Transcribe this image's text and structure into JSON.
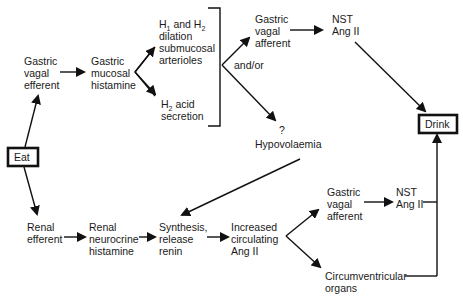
{
  "diagram": {
    "title": "",
    "nodes": {
      "eat": {
        "label": "Eat"
      },
      "drink": {
        "label": "Drink"
      },
      "gastric_vagal_efferent": {
        "lines": [
          "Gastric",
          "vagal",
          "efferent"
        ]
      },
      "gastric_mucosal_histamine": {
        "lines": [
          "Gastric",
          "mucosal",
          "histamine"
        ]
      },
      "h1_h2_dilation": {
        "line1_a": "H",
        "line1_sub1": "1",
        "line1_b": " and H",
        "line1_sub2": "2",
        "lines": [
          "dilation",
          "submucosal",
          "arterioles"
        ]
      },
      "h2_acid_secretion": {
        "line1_a": "H",
        "line1_sub": "2",
        "line1_b": " acid",
        "lines": [
          "secretion"
        ]
      },
      "gastric_vagal_afferent_top": {
        "lines": [
          "Gastric",
          "vagal",
          "afferent"
        ]
      },
      "nst_ang_ii_top": {
        "lines": [
          "NST",
          "Ang II"
        ]
      },
      "hypovolaemia": {
        "question": "?",
        "label": "Hypovolaemia"
      },
      "renal_efferent": {
        "lines": [
          "Renal",
          "efferent"
        ]
      },
      "renal_neurocrine_histamine": {
        "lines": [
          "Renal",
          "neurocrine",
          "histamine"
        ]
      },
      "synthesis_release_renin": {
        "lines": [
          "Synthesis,",
          "release",
          "renin"
        ]
      },
      "increased_circulating_ang_ii": {
        "lines": [
          "Increased",
          "circulating",
          "Ang II"
        ]
      },
      "gastric_vagal_afferent_bottom": {
        "lines": [
          "Gastric",
          "vagal",
          "afferent"
        ]
      },
      "nst_ang_ii_bottom": {
        "lines": [
          "NST",
          "Ang II"
        ]
      },
      "circumventricular_organs": {
        "lines": [
          "Circumventricular",
          "organs"
        ]
      }
    },
    "edge_labels": {
      "and_or": "and/or"
    },
    "edges": [
      {
        "from": "eat",
        "to": "gastric_vagal_efferent"
      },
      {
        "from": "eat",
        "to": "renal_efferent"
      },
      {
        "from": "gastric_vagal_efferent",
        "to": "gastric_mucosal_histamine"
      },
      {
        "from": "gastric_mucosal_histamine",
        "to": "h1_h2_dilation"
      },
      {
        "from": "gastric_mucosal_histamine",
        "to": "h2_acid_secretion"
      },
      {
        "from": "bracket",
        "to": "gastric_vagal_afferent_top",
        "label": "and/or"
      },
      {
        "from": "bracket",
        "to": "hypovolaemia",
        "label": "and/or"
      },
      {
        "from": "gastric_vagal_afferent_top",
        "to": "nst_ang_ii_top"
      },
      {
        "from": "nst_ang_ii_top",
        "to": "drink"
      },
      {
        "from": "hypovolaemia",
        "to": "synthesis_release_renin"
      },
      {
        "from": "renal_efferent",
        "to": "renal_neurocrine_histamine"
      },
      {
        "from": "renal_neurocrine_histamine",
        "to": "synthesis_release_renin"
      },
      {
        "from": "synthesis_release_renin",
        "to": "increased_circulating_ang_ii"
      },
      {
        "from": "increased_circulating_ang_ii",
        "to": "gastric_vagal_afferent_bottom"
      },
      {
        "from": "increased_circulating_ang_ii",
        "to": "circumventricular_organs"
      },
      {
        "from": "gastric_vagal_afferent_bottom",
        "to": "nst_ang_ii_bottom"
      },
      {
        "from": "nst_ang_ii_bottom",
        "to": "drink"
      },
      {
        "from": "circumventricular_organs",
        "to": "drink"
      }
    ]
  }
}
